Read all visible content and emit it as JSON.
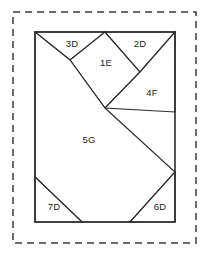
{
  "figure": {
    "canvas": {
      "width": 206,
      "height": 254
    },
    "colors": {
      "background": "#ffffff",
      "stroke": "#2b2b2b",
      "dashed_stroke": "#3a3a3a",
      "label_text": "#1c1c1c",
      "piece_fill": "#ffffff"
    },
    "dashed_border": {
      "name": "dashed-selection-border",
      "x": 13,
      "y": 12,
      "width": 183,
      "height": 231,
      "dash": "7 5"
    },
    "outer_rectangle": {
      "name": "tangram-outer-rectangle",
      "x": 35,
      "y": 32,
      "width": 140,
      "height": 190
    },
    "pieces": [
      {
        "id": "3D",
        "label": "3D",
        "shape": "triangle",
        "points": "35,32 105,32 70,60 35,32",
        "label_x": 72,
        "label_y": 44
      },
      {
        "id": "1E",
        "label": "1E",
        "shape": "square-diamond",
        "points": "105,32 140,72 105,108 70,60",
        "label_x": 106,
        "label_y": 63
      },
      {
        "id": "2D",
        "label": "2D",
        "shape": "triangle",
        "points": "105,32 175,32 140,72",
        "label_x": 140,
        "label_y": 44
      },
      {
        "id": "4F",
        "label": "4F",
        "shape": "parallelogram",
        "points": "140,72 175,32 175,112 105,108",
        "label_x": 152,
        "label_y": 93
      },
      {
        "id": "5G",
        "label": "5G",
        "shape": "polygon",
        "points": "35,32 70,60 105,108 175,172 130,222 82,222 35,177",
        "label_x": 89,
        "label_y": 140
      },
      {
        "id": "7D",
        "label": "7D",
        "shape": "triangle",
        "points": "35,177 82,222 35,222",
        "label_x": 54,
        "label_y": 207
      },
      {
        "id": "6D",
        "label": "6D",
        "shape": "triangle",
        "points": "175,172 175,222 130,222",
        "label_x": 160,
        "label_y": 207
      }
    ]
  }
}
